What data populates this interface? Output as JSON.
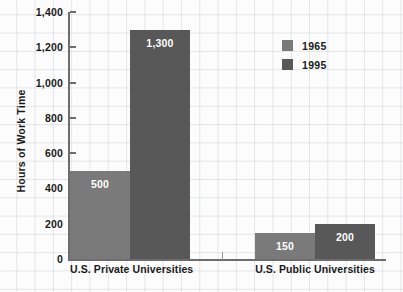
{
  "chart_data": {
    "type": "bar",
    "title": "",
    "xlabel": "",
    "ylabel": "Hours of Work Time",
    "ylim": [
      0,
      1400
    ],
    "yticks": [
      0,
      200,
      400,
      600,
      800,
      1000,
      1200,
      1400
    ],
    "ytick_labels": [
      "0",
      "200",
      "400",
      "600",
      "800",
      "1,000",
      "1,200",
      "1,400"
    ],
    "grid": true,
    "legend_position": "top-right",
    "categories": [
      "U.S. Private Universities",
      "U.S. Public Universities"
    ],
    "series": [
      {
        "name": "1965",
        "color": "#7a7a7a",
        "values": [
          500,
          150
        ],
        "value_labels": [
          "500",
          "150"
        ]
      },
      {
        "name": "1995",
        "color": "#585858",
        "values": [
          1300,
          200
        ],
        "value_labels": [
          "1,300",
          "200"
        ]
      }
    ]
  },
  "legend": {
    "items": [
      {
        "label": "1965",
        "color": "#7a7a7a"
      },
      {
        "label": "1995",
        "color": "#585858"
      }
    ]
  },
  "axis": {
    "y_title": "Hours of Work Time",
    "ticks": [
      {
        "label": "1,400",
        "value": 1400
      },
      {
        "label": "1,200",
        "value": 1200
      },
      {
        "label": "1,000",
        "value": 1000
      },
      {
        "label": "800",
        "value": 800
      },
      {
        "label": "600",
        "value": 600
      },
      {
        "label": "400",
        "value": 400
      },
      {
        "label": "200",
        "value": 200
      },
      {
        "label": "0",
        "value": 0
      }
    ]
  },
  "groups": [
    {
      "label": "U.S. Private Universities"
    },
    {
      "label": "U.S. Public Universities"
    }
  ]
}
